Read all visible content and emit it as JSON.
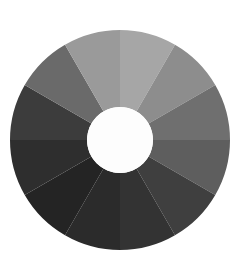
{
  "figure": {
    "title": "",
    "background_color": "#ffffff",
    "width": 243,
    "height": 278
  },
  "wheel": {
    "name": "grayscale-color-wheel",
    "center_x": 120,
    "center_y": 140,
    "outer_radius": 110,
    "inner_radius": 33,
    "segment_count": 12,
    "segment_angle_degrees": 30,
    "start_angle_degrees": -90,
    "hub_color": "#fdfdfd",
    "gap_degrees": 0
  },
  "chart_data": {
    "type": "pie",
    "title": "",
    "subtitle": "",
    "xlabel": "",
    "ylabel": "",
    "legend_position": "none",
    "grid": false,
    "hole_fraction": 0.3,
    "start_angle": 90,
    "direction": "clockwise",
    "categories": [
      "Segment 1",
      "Segment 2",
      "Segment 3",
      "Segment 4",
      "Segment 5",
      "Segment 6",
      "Segment 7",
      "Segment 8",
      "Segment 9",
      "Segment 10",
      "Segment 11",
      "Segment 12"
    ],
    "values": [
      8.333,
      8.333,
      8.333,
      8.333,
      8.333,
      8.333,
      8.333,
      8.333,
      8.333,
      8.333,
      8.333,
      8.333
    ],
    "colors": [
      "#a6a6a6",
      "#8d8d8d",
      "#6f6f6f",
      "#5e5e5e",
      "#3f3f3f",
      "#333333",
      "#2b2b2b",
      "#242424",
      "#2e2e2e",
      "#3c3c3c",
      "#6a6a6a",
      "#9a9a9a"
    ],
    "angles_start": [
      -90,
      -60,
      -30,
      0,
      30,
      60,
      90,
      120,
      150,
      180,
      210,
      240
    ],
    "angles_end": [
      -60,
      -30,
      0,
      30,
      60,
      90,
      120,
      150,
      180,
      210,
      240,
      270
    ]
  }
}
